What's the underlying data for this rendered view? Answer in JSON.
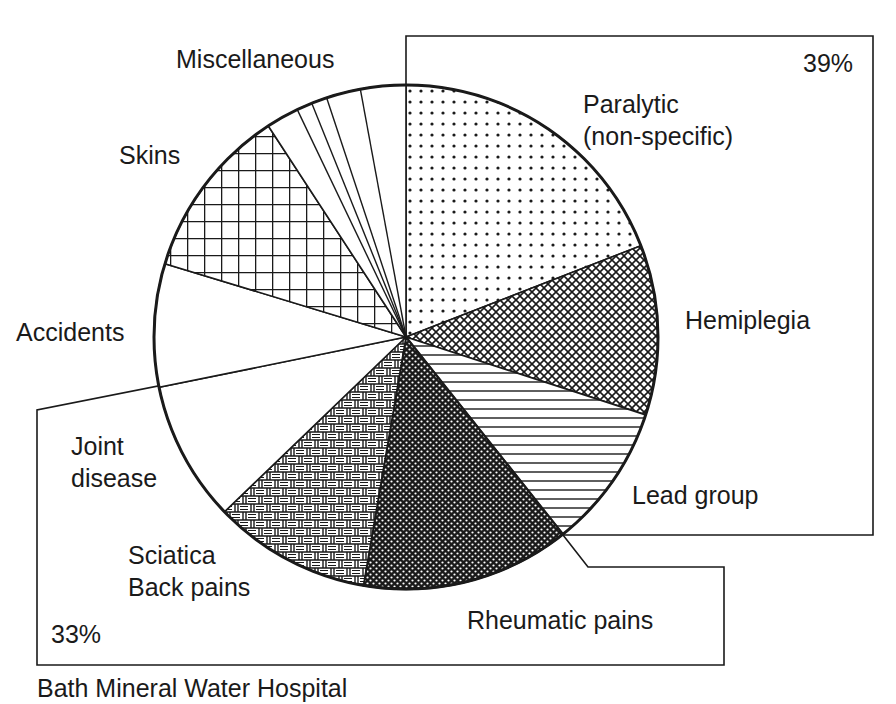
{
  "chart_data": {
    "type": "pie",
    "title": "",
    "caption": "Bath Mineral Water Hospital",
    "start_angle_deg": 0,
    "direction": "clockwise",
    "unit": "percent",
    "slices": [
      {
        "label": "Paralytic (non-specific)",
        "value": 19.1,
        "pattern": "dots"
      },
      {
        "label": "Hemiplegia",
        "value": 10.9,
        "pattern": "diamond-mesh"
      },
      {
        "label": "Lead group",
        "value": 9.3,
        "pattern": "horizontal-lines"
      },
      {
        "label": "Rheumatic pains",
        "value": 13.4,
        "pattern": "dense-dark-mesh"
      },
      {
        "label": "Sciatica Back pains",
        "value": 10.1,
        "pattern": "basketweave"
      },
      {
        "label": "Joint disease",
        "value": 9.0,
        "pattern": "blank"
      },
      {
        "label": "Accidents",
        "value": 7.9,
        "pattern": "blank"
      },
      {
        "label": "Skins",
        "value": 11.1,
        "pattern": "grid"
      },
      {
        "label": "Miscellaneous",
        "value": 9.2,
        "pattern": "blank-subdivided",
        "sub_values": [
          2.1,
          1.0,
          1.0,
          2.2,
          2.9
        ]
      }
    ],
    "groups": [
      {
        "label": "39%",
        "members": [
          "Paralytic (non-specific)",
          "Hemiplegia",
          "Lead group"
        ],
        "value": 39
      },
      {
        "label": "33%",
        "members": [
          "Rheumatic pains",
          "Sciatica Back pains",
          "Joint disease"
        ],
        "value": 33
      }
    ],
    "legend": "none",
    "grid": false
  },
  "labels": {
    "paralytic_line1": "Paralytic",
    "paralytic_line2": "(non-specific)",
    "hemiplegia": "Hemiplegia",
    "lead": "Lead group",
    "rheumatic": "Rheumatic pains",
    "sciatica_line1": "Sciatica",
    "sciatica_line2": "Back pains",
    "joint_line1": "Joint",
    "joint_line2": "disease",
    "accidents": "Accidents",
    "skins": "Skins",
    "misc": "Miscellaneous",
    "group_top_pct": "39%",
    "group_bottom_pct": "33%",
    "caption": "Bath Mineral Water Hospital"
  },
  "colors": {
    "ink": "#1a1a1a",
    "background": "#ffffff"
  }
}
